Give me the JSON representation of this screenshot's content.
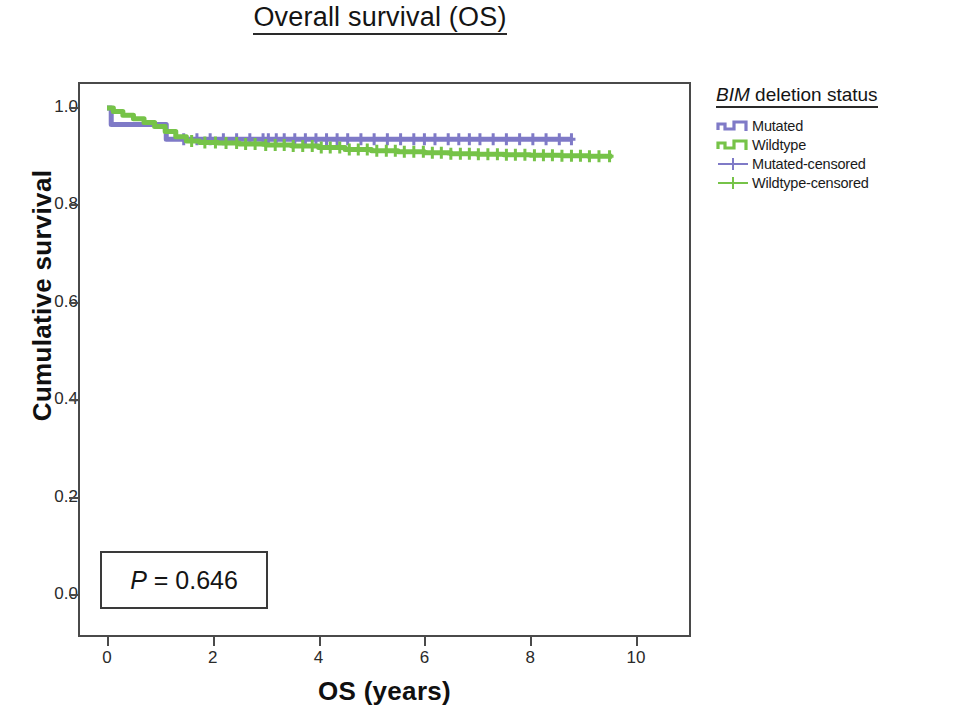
{
  "title": {
    "text": "Overall survival (OS)"
  },
  "axes": {
    "x": {
      "label": "OS (years)",
      "ticks": [
        "0",
        "2",
        "4",
        "6",
        "8",
        "10"
      ],
      "tick_values": [
        0,
        2,
        4,
        6,
        8,
        10
      ],
      "min": 0,
      "max": 10
    },
    "y": {
      "label": "Cumulative survival",
      "ticks": [
        "1.0",
        "0.8",
        "0.6",
        "0.4",
        "0.2",
        "0.0"
      ],
      "tick_values": [
        1.0,
        0.8,
        0.6,
        0.4,
        0.2,
        0.0
      ],
      "min": 0,
      "max": 1.0
    }
  },
  "annotations": {
    "pvalue": {
      "prefix": "P",
      "body": " = 0.646",
      "full": "P = 0.646"
    }
  },
  "legend": {
    "title_italic": "BIM",
    "title_rest": " deletion status",
    "title_full": "BIM deletion status",
    "position": "right",
    "items": [
      {
        "label": "Mutated",
        "color": "#7f7ac7",
        "marker": "step-line"
      },
      {
        "label": "Wildtype",
        "color": "#76c348",
        "marker": "step-line"
      },
      {
        "label": "Mutated-censored",
        "color": "#7f7ac7",
        "marker": "plus"
      },
      {
        "label": "Wildtype-censored",
        "color": "#76c348",
        "marker": "plus"
      }
    ]
  },
  "colors": {
    "mutated": "#7f7ac7",
    "wildtype": "#76c348",
    "axis": "#4a4a4a",
    "text": "#1a1a1a",
    "background": "#ffffff"
  },
  "chart_data": {
    "type": "line",
    "subtype": "kaplan-meier-survival",
    "title": "Overall survival (OS)",
    "xlabel": "OS (years)",
    "ylabel": "Cumulative survival",
    "xlim": [
      0,
      10
    ],
    "ylim": [
      0,
      1.0
    ],
    "grid": false,
    "legend_position": "right",
    "legend_title": "BIM deletion status",
    "pvalue": 0.646,
    "series": [
      {
        "name": "Mutated",
        "color": "#7f7ac7",
        "step": "post",
        "points": [
          [
            0.0,
            1.0
          ],
          [
            0.08,
            0.966
          ],
          [
            1.05,
            0.966
          ],
          [
            1.12,
            0.936
          ],
          [
            8.8,
            0.936
          ]
        ],
        "censored": [
          1.45,
          1.7,
          1.95,
          2.2,
          2.45,
          2.7,
          2.95,
          3.05,
          3.2,
          3.35,
          3.55,
          3.75,
          3.95,
          4.15,
          4.35,
          4.55,
          4.8,
          5.05,
          5.3,
          5.55,
          5.8,
          6.0,
          6.2,
          6.45,
          6.65,
          6.85,
          7.05,
          7.3,
          7.55,
          7.8,
          8.05,
          8.3,
          8.55,
          8.78
        ]
      },
      {
        "name": "Wildtype",
        "color": "#76c348",
        "step": "post",
        "points": [
          [
            0.0,
            1.0
          ],
          [
            0.12,
            0.993
          ],
          [
            0.3,
            0.985
          ],
          [
            0.5,
            0.978
          ],
          [
            0.7,
            0.97
          ],
          [
            0.9,
            0.962
          ],
          [
            1.1,
            0.952
          ],
          [
            1.3,
            0.941
          ],
          [
            1.5,
            0.932
          ],
          [
            1.75,
            0.929
          ],
          [
            2.1,
            0.928
          ],
          [
            2.5,
            0.926
          ],
          [
            3.0,
            0.924
          ],
          [
            3.5,
            0.922
          ],
          [
            4.0,
            0.919
          ],
          [
            4.5,
            0.915
          ],
          [
            5.0,
            0.912
          ],
          [
            5.5,
            0.91
          ],
          [
            6.0,
            0.908
          ],
          [
            6.5,
            0.906
          ],
          [
            7.0,
            0.905
          ],
          [
            7.5,
            0.904
          ],
          [
            8.0,
            0.903
          ],
          [
            8.6,
            0.902
          ],
          [
            9.1,
            0.901
          ],
          [
            9.55,
            0.901
          ]
        ],
        "censored": [
          1.6,
          1.85,
          2.05,
          2.25,
          2.45,
          2.62,
          2.8,
          3.0,
          3.18,
          3.35,
          3.52,
          3.7,
          3.88,
          4.05,
          4.22,
          4.4,
          4.58,
          4.75,
          4.92,
          5.1,
          5.28,
          5.45,
          5.62,
          5.8,
          5.98,
          6.15,
          6.32,
          6.5,
          6.68,
          6.85,
          7.02,
          7.2,
          7.38,
          7.55,
          7.72,
          7.9,
          8.08,
          8.25,
          8.42,
          8.6,
          8.78,
          8.95,
          9.12,
          9.3,
          9.5
        ]
      }
    ]
  }
}
